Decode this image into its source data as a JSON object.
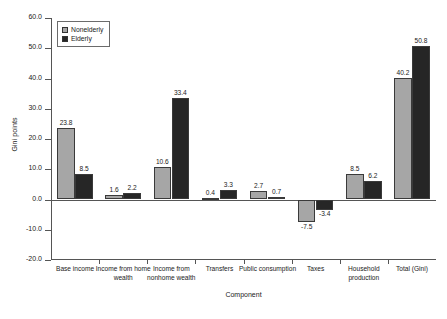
{
  "chart_data": {
    "type": "bar",
    "title": "",
    "subtitle": "",
    "xlabel": "Component",
    "ylabel": "Gini points",
    "ylim": [
      -20.0,
      60.0
    ],
    "ytick_step": 10.0,
    "ytick_labels": [
      "60.0",
      "50.0",
      "40.0",
      "30.0",
      "20.0",
      "10.0",
      "0.0",
      "-10.0",
      "-20.0"
    ],
    "ytick_values": [
      60.0,
      50.0,
      40.0,
      30.0,
      20.0,
      10.0,
      0.0,
      -10.0,
      -20.0
    ],
    "grid": false,
    "legend_position": "upper-left-inside",
    "categories": [
      "Base income",
      "Income from home wealth",
      "Income from nonhome wealth",
      "Transfers",
      "Public consumption",
      "Taxes",
      "Household production",
      "Total (Gini)"
    ],
    "series": [
      {
        "name": "Nonelderly",
        "color": "#a6a6a6",
        "values": [
          23.8,
          1.6,
          10.6,
          0.4,
          2.7,
          -7.5,
          8.5,
          40.2
        ],
        "labels": [
          "23.8",
          "1.6",
          "10.6",
          "0.4",
          "2.7",
          "-7.5",
          "8.5",
          "40.2"
        ]
      },
      {
        "name": "Elderly",
        "color": "#262626",
        "values": [
          8.5,
          2.2,
          33.4,
          3.3,
          0.7,
          -3.4,
          6.2,
          50.8
        ],
        "labels": [
          "8.5",
          "2.2",
          "33.4",
          "3.3",
          "0.7",
          "-3.4",
          "6.2",
          "50.8"
        ]
      }
    ]
  },
  "legend": {
    "items": [
      {
        "label": "Nonelderly"
      },
      {
        "label": "Elderly"
      }
    ]
  }
}
